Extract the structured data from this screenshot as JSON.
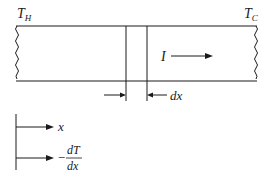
{
  "diagram": {
    "labels": {
      "hot_end": "T",
      "hot_end_sub": "H",
      "cold_end": "T",
      "cold_end_sub": "C",
      "current": "I",
      "element_width": "dx"
    },
    "legend": {
      "x_axis_label": "x",
      "gradient_minus": "−",
      "gradient_numerator": "dT",
      "gradient_denominator": "dx"
    },
    "colors": {
      "stroke": "#1a1a1a",
      "background": "#ffffff"
    }
  }
}
